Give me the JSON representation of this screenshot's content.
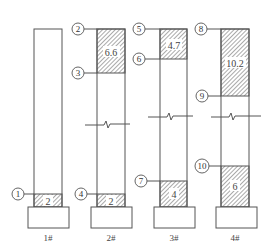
{
  "diagram": {
    "type": "pile/column segment diagram",
    "columns": [
      {
        "label": "1#",
        "hatched": [
          {
            "value": "2",
            "top_marker": "1"
          }
        ],
        "break": false
      },
      {
        "label": "2#",
        "hatched": [
          {
            "value": "6.6",
            "top_marker": "2",
            "bottom_marker": "3"
          },
          {
            "value": "2",
            "top_marker": "4"
          }
        ],
        "break": true
      },
      {
        "label": "3#",
        "hatched": [
          {
            "value": "4.7",
            "top_marker": "5",
            "bottom_marker": "6"
          },
          {
            "value": "4",
            "top_marker": "7"
          }
        ],
        "break": true
      },
      {
        "label": "4#",
        "hatched": [
          {
            "value": "10.2",
            "top_marker": "8",
            "bottom_marker": "9"
          },
          {
            "value": "6",
            "top_marker": "10"
          }
        ],
        "break": true
      }
    ],
    "markers": [
      "1",
      "2",
      "3",
      "4",
      "5",
      "6",
      "7",
      "8",
      "9",
      "10"
    ],
    "values": {
      "c1_bottom": "2",
      "c2_top": "6.6",
      "c2_bottom": "2",
      "c3_top": "4.7",
      "c3_bottom": "4",
      "c4_top": "10.2",
      "c4_bottom": "6"
    },
    "labels": {
      "c1": "1#",
      "c2": "2#",
      "c3": "3#",
      "c4": "4#"
    }
  }
}
